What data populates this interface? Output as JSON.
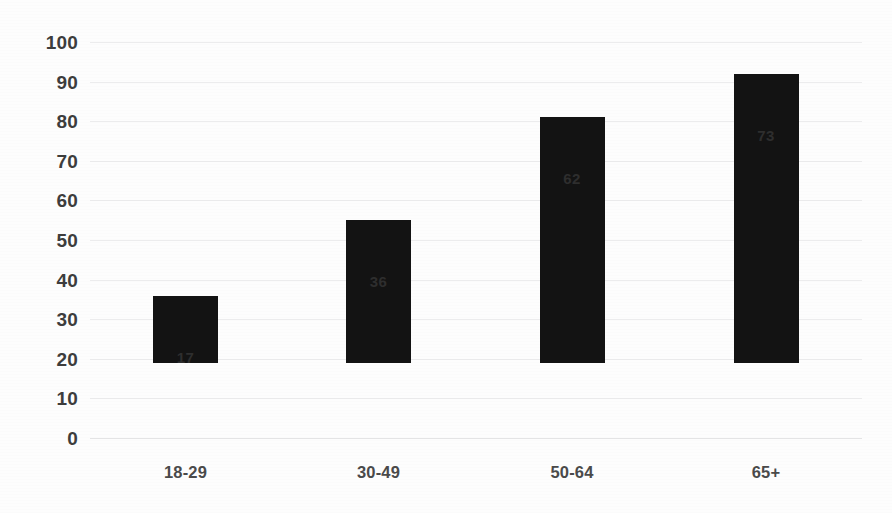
{
  "chart_data": {
    "type": "bar",
    "title": "",
    "subtitle": "",
    "xlabel": "",
    "ylabel": "",
    "categories": [
      "18-29",
      "30-49",
      "50-64",
      "65+"
    ],
    "values": [
      17,
      36,
      62,
      73
    ],
    "data_labels": [
      "17",
      "36",
      "62",
      "73"
    ],
    "ylim": [
      0,
      100
    ],
    "y_ticks": [
      100,
      90,
      80,
      70,
      60,
      50,
      40,
      30,
      20,
      10,
      0
    ],
    "y_tick_labels": [
      "100",
      "90",
      "80",
      "70",
      "60",
      "50",
      "40",
      "30",
      "20",
      "10",
      "0"
    ],
    "grid": true,
    "grid_axis": "y",
    "legend": false,
    "legend_position": "none",
    "orientation": "vertical",
    "series": [
      {
        "name": "",
        "values": [
          17,
          36,
          62,
          73
        ]
      }
    ]
  },
  "style": {
    "bar_color": "#131313",
    "background_color": "#fdfdfd",
    "gridline_color": "#ececed",
    "tick_label_color": "#3d3d3d",
    "data_label_color": "#2e2e2e",
    "category_label_color": "#4a4a4a"
  }
}
